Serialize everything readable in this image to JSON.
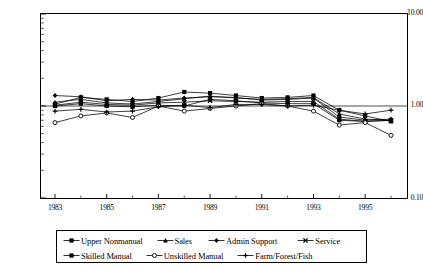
{
  "chart_data": {
    "type": "line",
    "title": "",
    "subtitle": "",
    "xlabel": "",
    "ylabel": "",
    "yscale": "log",
    "ylim": [
      0.1,
      10.0
    ],
    "xlim": [
      1983,
      1996
    ],
    "grid": false,
    "reference_line_y": 1.0,
    "legend_position": "bottom",
    "y_tick_labels": [
      "10.00",
      "1.00",
      "0.10"
    ],
    "y_tick_values": [
      10.0,
      1.0,
      0.1
    ],
    "x_tick_labels": [
      "1983",
      "1985",
      "1987",
      "1989",
      "1991",
      "1993",
      "1995"
    ],
    "x_tick_values": [
      1983,
      1985,
      1987,
      1989,
      1991,
      1993,
      1995
    ],
    "x": [
      1983,
      1984,
      1985,
      1986,
      1987,
      1988,
      1989,
      1990,
      1991,
      1992,
      1993,
      1994,
      1995,
      1996
    ],
    "series": [
      {
        "name": "Upper Nonmanual",
        "marker": "square",
        "values": [
          1.05,
          1.24,
          1.18,
          1.12,
          1.22,
          1.42,
          1.38,
          1.3,
          1.22,
          1.24,
          1.3,
          0.9,
          0.78,
          0.68
        ]
      },
      {
        "name": "Sales",
        "marker": "triangle",
        "values": [
          1.1,
          1.18,
          1.08,
          1.05,
          1.12,
          1.2,
          1.28,
          1.22,
          1.18,
          1.2,
          1.24,
          0.82,
          0.72,
          0.7
        ]
      },
      {
        "name": "Admin Support",
        "marker": "diamond",
        "values": [
          1.3,
          1.26,
          1.14,
          1.18,
          1.16,
          1.22,
          1.26,
          1.24,
          1.16,
          1.18,
          1.22,
          0.76,
          0.7,
          0.72
        ]
      },
      {
        "name": "Service",
        "marker": "cross",
        "values": [
          1.02,
          1.1,
          1.04,
          1.02,
          1.08,
          1.1,
          1.14,
          1.12,
          1.1,
          1.12,
          1.12,
          0.72,
          0.68,
          0.7
        ]
      },
      {
        "name": "Skilled Manual",
        "marker": "square",
        "values": [
          1.0,
          1.06,
          1.0,
          0.98,
          1.02,
          1.0,
          1.18,
          1.14,
          1.08,
          1.06,
          1.06,
          0.7,
          0.68,
          0.7
        ]
      },
      {
        "name": "Unskilled Manual",
        "marker": "circle-open",
        "values": [
          0.66,
          0.78,
          0.84,
          0.75,
          1.0,
          0.88,
          0.94,
          1.0,
          1.06,
          1.0,
          0.88,
          0.62,
          0.66,
          0.48
        ]
      },
      {
        "name": "Farm/Forest/Fish",
        "marker": "plus",
        "values": [
          0.88,
          0.92,
          0.86,
          0.88,
          0.98,
          1.02,
          0.96,
          1.04,
          1.04,
          1.0,
          1.02,
          0.9,
          0.82,
          0.9
        ]
      }
    ]
  },
  "legend": {
    "rows": [
      [
        {
          "label": "Upper Nonmanual",
          "marker": "square"
        },
        {
          "label": "Sales",
          "marker": "triangle"
        },
        {
          "label": "Admin Support",
          "marker": "diamond"
        },
        {
          "label": "Service",
          "marker": "cross"
        }
      ],
      [
        {
          "label": "Skilled Manual",
          "marker": "square"
        },
        {
          "label": "Unskilled Manual",
          "marker": "circle-open"
        },
        {
          "label": "Farm/Forest/Fish",
          "marker": "plus"
        }
      ]
    ]
  },
  "colors": {
    "line": "#000000",
    "axis": "#000000",
    "background": "#ffffff"
  }
}
